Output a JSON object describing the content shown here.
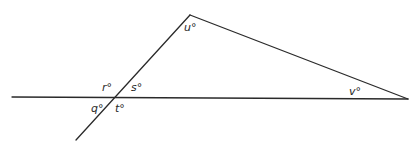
{
  "diagram": {
    "type": "geometry-angles",
    "stroke_color": "#2a2a2a",
    "vertices": {
      "apex": [
        190,
        15
      ],
      "intersection": [
        115,
        97
      ],
      "right": [
        408,
        99
      ],
      "left_end": [
        12,
        97
      ],
      "lower_end": [
        76,
        140
      ]
    },
    "labels": [
      {
        "id": "u",
        "text": "u°",
        "x": 184,
        "y": 31
      },
      {
        "id": "r",
        "text": "r°",
        "x": 102,
        "y": 91
      },
      {
        "id": "s",
        "text": "s°",
        "x": 131,
        "y": 91
      },
      {
        "id": "q",
        "text": "q°",
        "x": 91,
        "y": 112
      },
      {
        "id": "t",
        "text": "t°",
        "x": 115,
        "y": 112
      },
      {
        "id": "v",
        "text": "v°",
        "x": 349,
        "y": 95
      }
    ]
  }
}
